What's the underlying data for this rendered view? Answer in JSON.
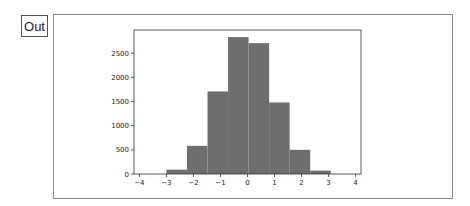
{
  "cell": {
    "prompt_label": "Out"
  },
  "colors": {
    "bar_fill": "#6e6e6e",
    "axes_edge": "#333333",
    "frame_border": "#8a8a8a"
  },
  "chart_data": {
    "type": "bar",
    "title": "",
    "xlabel": "",
    "ylabel": "",
    "histogram": true,
    "bin_edges": [
      -3.0,
      -2.24,
      -1.48,
      -0.72,
      0.04,
      0.8,
      1.56,
      2.32,
      3.08
    ],
    "values": [
      90,
      583,
      1708,
      2833,
      2708,
      1480,
      500,
      70
    ],
    "xlim": [
      -4.2,
      4.2
    ],
    "ylim": [
      0,
      2980
    ],
    "xticks": [
      -4,
      -3,
      -2,
      -1,
      0,
      1,
      2,
      3,
      4
    ],
    "xtick_labels": [
      "−4",
      "−3",
      "−2",
      "−1",
      "0",
      "1",
      "2",
      "3",
      "4"
    ],
    "yticks": [
      0,
      500,
      1000,
      1500,
      2000,
      2500
    ],
    "ytick_labels": [
      "0",
      "500",
      "1000",
      "1500",
      "2000",
      "2500"
    ],
    "grid": false,
    "legend": null
  }
}
